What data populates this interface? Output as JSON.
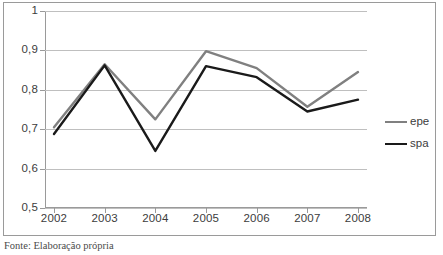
{
  "caption": "Fonte: Elaboração própria",
  "legend": {
    "items": [
      {
        "label": "epe",
        "color": "#808080"
      },
      {
        "label": "spa",
        "color": "#1a1a1a"
      }
    ]
  },
  "axes": {
    "y_ticks": [
      "1",
      "0,9",
      "0,8",
      "0,7",
      "0,6",
      "0,5"
    ],
    "x_ticks": [
      "2002",
      "2003",
      "2004",
      "2005",
      "2006",
      "2007",
      "2008"
    ]
  },
  "chart_data": {
    "type": "line",
    "title": "",
    "xlabel": "",
    "ylabel": "",
    "categories": [
      "2002",
      "2003",
      "2004",
      "2005",
      "2006",
      "2007",
      "2008"
    ],
    "x": [
      2002,
      2003,
      2004,
      2005,
      2006,
      2007,
      2008
    ],
    "series": [
      {
        "name": "epe",
        "color": "#808080",
        "values": [
          0.705,
          0.865,
          0.725,
          0.898,
          0.855,
          0.757,
          0.845
        ]
      },
      {
        "name": "spa",
        "color": "#1a1a1a",
        "values": [
          0.688,
          0.862,
          0.645,
          0.86,
          0.832,
          0.745,
          0.775
        ]
      }
    ],
    "ylim": [
      0.5,
      1.0
    ],
    "ytick_values": [
      1.0,
      0.9,
      0.8,
      0.7,
      0.6,
      0.5
    ],
    "ytick_labels": [
      "1",
      "0,9",
      "0,8",
      "0,7",
      "0,6",
      "0,5"
    ],
    "grid": true,
    "grid_axis": "y",
    "legend_position": "right",
    "markers": false,
    "decimal_separator": ","
  }
}
